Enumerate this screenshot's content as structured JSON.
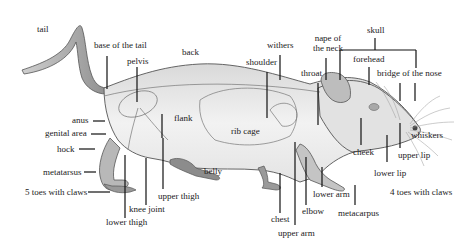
{
  "diagram": {
    "labels": {
      "tail": "tail",
      "base_of_tail": "base of the tail",
      "pelvis": "pelvis",
      "back": "back",
      "withers": "withers",
      "shoulder": "shoulder",
      "nape_line1": "nape of",
      "nape_line2": "the neck",
      "skull": "skull",
      "forehead": "forehead",
      "throat": "throat",
      "bridge_of_nose": "bridge of the nose",
      "anus": "anus",
      "genital_area": "genital area",
      "hock": "hock",
      "flank": "flank",
      "rib_cage": "rib cage",
      "metatarsus": "metatarsus",
      "toes_hind": "5 toes with claws",
      "belly": "belly",
      "upper_thigh": "upper thigh",
      "knee_joint": "knee joint",
      "lower_thigh": "lower thigh",
      "cheek": "cheek",
      "whiskers": "whiskers",
      "upper_lip": "upper lip",
      "lower_lip": "lower lip",
      "lower_arm": "lower arm",
      "elbow": "elbow",
      "chest": "chest",
      "upper_arm": "upper arm",
      "metacarpus": "metacarpus",
      "toes_fore": "4 toes with claws"
    },
    "colors": {
      "ink": "#1a1a1a",
      "body_fill": "#ececec",
      "shade": "#9a9a9a"
    }
  }
}
